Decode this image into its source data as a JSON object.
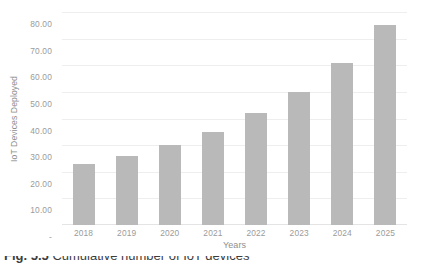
{
  "chart_data": {
    "type": "bar",
    "title": "",
    "subtitle": "",
    "xlabel": "Years",
    "ylabel": "IoT Devices Deployed",
    "categories": [
      "2018",
      "2019",
      "2020",
      "2021",
      "2022",
      "2023",
      "2024",
      "2025"
    ],
    "values": [
      23,
      26,
      30,
      35,
      42,
      50,
      61,
      75
    ],
    "ylim": [
      0,
      80
    ],
    "ytick_values": [
      0,
      10,
      20,
      30,
      40,
      50,
      60,
      70,
      80
    ],
    "ytick_labels": [
      "-",
      "10.00",
      "20.00",
      "30.00",
      "40.00",
      "50.00",
      "60.00",
      "70.00",
      "80.00"
    ],
    "grid": true,
    "grid_axis": "y",
    "legend": false,
    "legend_position": "none",
    "series": [
      {
        "name": "IoT Devices Deployed",
        "values": [
          23,
          26,
          30,
          35,
          42,
          50,
          61,
          75
        ]
      }
    ],
    "annotations": []
  },
  "colors": {
    "bar_fill": "#b9b9b9",
    "gridline": "#eeeeee",
    "axis_line": "#e4e4e4",
    "tick_label_text": "#9b9b9b",
    "axis_title_text": "#8f8f8f",
    "background": "#ffffff",
    "caption_text": "#3d3d3d"
  },
  "caption": {
    "figure_label": "Fig. 5.5",
    "text": "Cumulative number of IoT devices"
  }
}
